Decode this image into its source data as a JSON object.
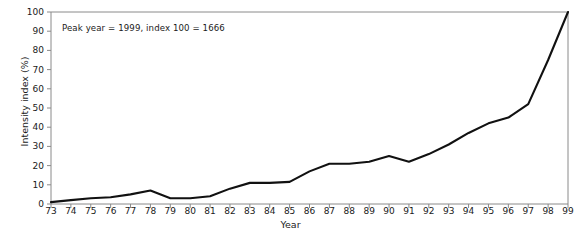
{
  "chart_data": {
    "type": "line",
    "title": "",
    "xlabel": "Year",
    "ylabel": "Intensity index (%)",
    "annotation": "Peak year = 1999, index 100 = 1666",
    "grid": false,
    "legend": "none",
    "xlim": [
      73,
      99
    ],
    "ylim": [
      0,
      100
    ],
    "yticks": [
      0,
      10,
      20,
      30,
      40,
      50,
      60,
      70,
      80,
      90,
      100
    ],
    "categories": [
      "73",
      "74",
      "75",
      "76",
      "77",
      "78",
      "79",
      "80",
      "81",
      "82",
      "83",
      "84",
      "85",
      "86",
      "87",
      "88",
      "89",
      "90",
      "91",
      "92",
      "93",
      "94",
      "95",
      "96",
      "97",
      "98",
      "99"
    ],
    "x": [
      73,
      74,
      75,
      76,
      77,
      78,
      79,
      80,
      81,
      82,
      83,
      84,
      85,
      86,
      87,
      88,
      89,
      90,
      91,
      92,
      93,
      94,
      95,
      96,
      97,
      98,
      99
    ],
    "values": [
      1,
      2,
      3,
      3.5,
      5,
      7,
      3,
      3,
      4,
      8,
      11,
      11,
      11.5,
      17,
      21,
      21,
      22,
      25,
      22,
      26,
      31,
      37,
      42,
      45,
      52,
      75,
      100
    ],
    "series": [
      {
        "name": "Intensity index",
        "color": "#111111",
        "values": [
          1,
          2,
          3,
          3.5,
          5,
          7,
          3,
          3,
          4,
          8,
          11,
          11,
          11.5,
          17,
          21,
          21,
          22,
          25,
          22,
          26,
          31,
          37,
          42,
          45,
          52,
          75,
          100
        ]
      }
    ],
    "line_color": "#111111",
    "axis_color": "#8a8a8a"
  },
  "clipped_header": ""
}
